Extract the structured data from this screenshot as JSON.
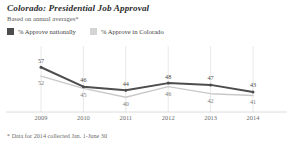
{
  "title": "Colorado: Presidential Job Approval",
  "subtitle": "Based on annual averages*",
  "footnote": "* Data for 2014 collected Jan. 1-June 30",
  "legend": {
    "items": [
      {
        "label": "% Approve nationally",
        "color": "#4d4d4d",
        "key": "nationally"
      },
      {
        "label": "% Approve in Colorado",
        "color": "#d4d4d4",
        "key": "colorado"
      }
    ]
  },
  "chart_data": {
    "type": "line",
    "title": "Colorado: Presidential Job Approval",
    "subtitle": "Based on annual averages*",
    "xlabel": "",
    "ylabel": "",
    "categories": [
      "2009",
      "2010",
      "2011",
      "2012",
      "2013",
      "2014"
    ],
    "x": [
      2009,
      2010,
      2011,
      2012,
      2013,
      2014
    ],
    "ylim": [
      35,
      60
    ],
    "grid": "vertical",
    "legend_position": "top-left",
    "series": [
      {
        "name": "% Approve nationally",
        "color": "#4d4d4d",
        "values": [
          57,
          46,
          44,
          48,
          47,
          43
        ],
        "labels": [
          "57",
          "46",
          "44",
          "48",
          "47",
          "43"
        ]
      },
      {
        "name": "% Approve in Colorado",
        "color": "#c9c9c9",
        "values": [
          52,
          45,
          40,
          46,
          42,
          41
        ],
        "labels": [
          "52",
          "45",
          "40",
          "46",
          "42",
          "41"
        ]
      }
    ],
    "annotations": [
      "* Data for 2014 collected Jan. 1-June 30"
    ]
  },
  "axis": {
    "ticks": [
      "2009",
      "2010",
      "2011",
      "2012",
      "2013",
      "2014"
    ]
  }
}
